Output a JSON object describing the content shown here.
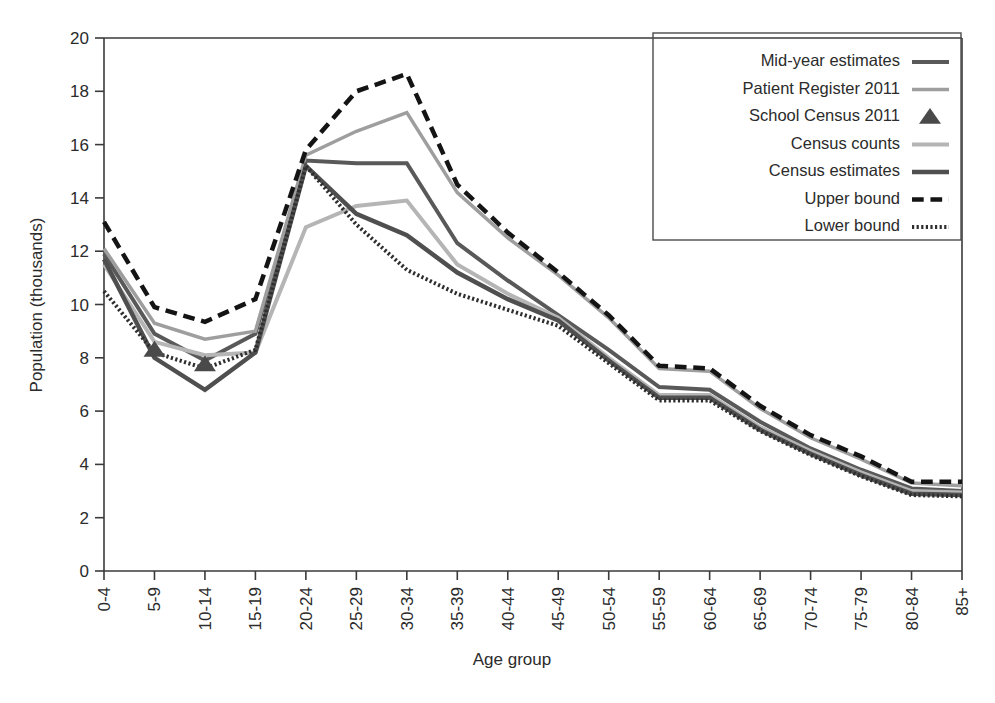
{
  "chart_data": {
    "type": "line",
    "title": "",
    "xlabel": "Age group",
    "ylabel": "Population (thousands)",
    "categories": [
      "0-4",
      "5-9",
      "10-14",
      "15-19",
      "20-24",
      "25-29",
      "30-34",
      "35-39",
      "40-44",
      "45-49",
      "50-54",
      "55-59",
      "60-64",
      "65-69",
      "70-74",
      "75-79",
      "80-84",
      "85+"
    ],
    "ylim": [
      0,
      20
    ],
    "yticks": [
      0,
      2,
      4,
      6,
      8,
      10,
      12,
      14,
      16,
      18,
      20
    ],
    "grid": false,
    "legend_position": "top-right",
    "series": [
      {
        "name": "Mid-year estimates",
        "style": "solid",
        "color": "#595959",
        "width": 4,
        "marker": "none",
        "values": [
          11.9,
          8.9,
          7.9,
          8.9,
          15.4,
          15.3,
          15.3,
          12.3,
          10.9,
          9.6,
          8.3,
          6.9,
          6.8,
          5.6,
          4.6,
          3.8,
          3.1,
          3.0
        ]
      },
      {
        "name": "Patient Register 2011",
        "style": "solid",
        "color": "#9e9e9e",
        "width": 3.5,
        "marker": "none",
        "values": [
          12.1,
          9.3,
          8.7,
          9.0,
          15.6,
          16.5,
          17.2,
          14.2,
          12.5,
          11.1,
          9.5,
          7.6,
          7.5,
          6.1,
          5.0,
          4.2,
          3.3,
          3.2
        ]
      },
      {
        "name": "School Census 2011",
        "style": "marker",
        "color": "#4a4a4a",
        "width": 0,
        "marker": "triangle",
        "values": [
          null,
          8.3,
          7.75,
          null,
          null,
          null,
          null,
          null,
          null,
          null,
          null,
          null,
          null,
          null,
          null,
          null,
          null,
          null
        ]
      },
      {
        "name": "Census counts",
        "style": "solid",
        "color": "#b5b5b5",
        "width": 4,
        "marker": "none",
        "values": [
          11.5,
          8.6,
          8.1,
          8.2,
          12.9,
          13.7,
          13.9,
          11.5,
          10.4,
          9.5,
          8.0,
          6.6,
          6.6,
          5.4,
          4.5,
          3.7,
          3.0,
          2.95
        ]
      },
      {
        "name": "Census estimates",
        "style": "solid",
        "color": "#4f4f4f",
        "width": 4.5,
        "marker": "none",
        "values": [
          11.7,
          8.0,
          6.8,
          8.2,
          15.2,
          13.4,
          12.6,
          11.2,
          10.2,
          9.4,
          7.9,
          6.5,
          6.5,
          5.3,
          4.4,
          3.6,
          2.9,
          2.85
        ]
      },
      {
        "name": "Upper bound",
        "style": "dashed",
        "color": "#141414",
        "width": 4.5,
        "marker": "none",
        "values": [
          13.1,
          9.9,
          9.35,
          10.2,
          15.8,
          18.0,
          18.65,
          14.5,
          12.7,
          11.2,
          9.6,
          7.7,
          7.6,
          6.2,
          5.1,
          4.3,
          3.35,
          3.35
        ]
      },
      {
        "name": "Lower bound",
        "style": "dotted",
        "color": "#2e2e2e",
        "width": 4,
        "marker": "none",
        "values": [
          10.5,
          8.2,
          7.6,
          8.3,
          15.2,
          13.0,
          11.3,
          10.4,
          9.8,
          9.2,
          7.8,
          6.4,
          6.4,
          5.25,
          4.35,
          3.55,
          2.85,
          2.8
        ]
      }
    ]
  },
  "axes": {
    "y_label": "Population (thousands)",
    "x_label": "Age group",
    "y_tick_labels": [
      "0",
      "2",
      "4",
      "6",
      "8",
      "10",
      "12",
      "14",
      "16",
      "18",
      "20"
    ],
    "x_tick_labels": [
      "0-4",
      "5-9",
      "10-14",
      "15-19",
      "20-24",
      "25-29",
      "30-34",
      "35-39",
      "40-44",
      "45-49",
      "50-54",
      "55-59",
      "60-64",
      "65-69",
      "70-74",
      "75-79",
      "80-84",
      "85+"
    ]
  },
  "legend": {
    "entries": [
      {
        "label": "Mid-year estimates",
        "swatch": "line-dark-gray"
      },
      {
        "label": "Patient Register 2011",
        "swatch": "line-mid-gray"
      },
      {
        "label": "School Census 2011",
        "swatch": "triangle-marker"
      },
      {
        "label": "Census counts",
        "swatch": "line-light-gray"
      },
      {
        "label": "Census estimates",
        "swatch": "line-charcoal"
      },
      {
        "label": "Upper bound",
        "swatch": "line-dashed-black"
      },
      {
        "label": "Lower bound",
        "swatch": "line-dotted-black"
      }
    ]
  },
  "colors": {
    "mid_year": "#595959",
    "patient_register": "#9e9e9e",
    "school_census": "#4a4a4a",
    "census_counts": "#b5b5b5",
    "census_estimates": "#4f4f4f",
    "upper_bound": "#141414",
    "lower_bound": "#2e2e2e",
    "axis": "#3a3a3a",
    "text": "#2b2b2b",
    "background": "#ffffff"
  }
}
